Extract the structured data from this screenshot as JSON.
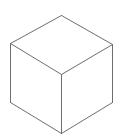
{
  "figure": {
    "shape": "isometric-cube",
    "stroke_color": "#6e6e6e",
    "fill_color": "#ffffff",
    "stroke_width": 1,
    "vertices": {
      "top": [
        61,
        15
      ],
      "left": [
        10,
        43
      ],
      "right": [
        112,
        44
      ],
      "center": [
        61,
        74
      ],
      "bottom_left": [
        10,
        102
      ],
      "bottom_right": [
        112,
        102
      ],
      "bottom": [
        61,
        133
      ]
    }
  }
}
